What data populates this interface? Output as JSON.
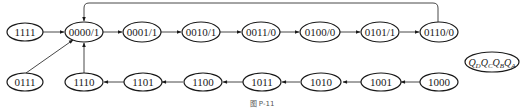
{
  "diagram": {
    "type": "state-transition",
    "legend": {
      "label": "Q_D Q_C Q_B Q_A",
      "parts": [
        "Q",
        "D",
        "Q",
        "C",
        "Q",
        "B",
        "Q",
        "A"
      ]
    },
    "caption": "图 P-11",
    "top_row": [
      {
        "id": "s1111",
        "label": "1111"
      },
      {
        "id": "s0000",
        "label": "0000/1"
      },
      {
        "id": "s0001",
        "label": "0001/1"
      },
      {
        "id": "s0010",
        "label": "0010/1"
      },
      {
        "id": "s0011",
        "label": "0011/0"
      },
      {
        "id": "s0100",
        "label": "0100/0"
      },
      {
        "id": "s0101",
        "label": "0101/1"
      },
      {
        "id": "s0110",
        "label": "0110/0"
      }
    ],
    "bottom_row": [
      {
        "id": "s0111",
        "label": "0111"
      },
      {
        "id": "s1110",
        "label": "1110"
      },
      {
        "id": "s1101",
        "label": "1101"
      },
      {
        "id": "s1100",
        "label": "1100"
      },
      {
        "id": "s1011",
        "label": "1011"
      },
      {
        "id": "s1010",
        "label": "1010"
      },
      {
        "id": "s1001",
        "label": "1001"
      },
      {
        "id": "s1000",
        "label": "1000"
      }
    ],
    "transitions": [
      [
        "1111",
        "0000"
      ],
      [
        "0000",
        "0001"
      ],
      [
        "0001",
        "0010"
      ],
      [
        "0010",
        "0011"
      ],
      [
        "0011",
        "0100"
      ],
      [
        "0100",
        "0101"
      ],
      [
        "0101",
        "0110"
      ],
      [
        "0110",
        "0000"
      ],
      [
        "0111",
        "0000"
      ],
      [
        "1110",
        "0000"
      ],
      [
        "1101",
        "1110"
      ],
      [
        "1100",
        "1101"
      ],
      [
        "1011",
        "1100"
      ],
      [
        "1010",
        "1011"
      ],
      [
        "1001",
        "1010"
      ],
      [
        "1000",
        "1001"
      ]
    ]
  }
}
